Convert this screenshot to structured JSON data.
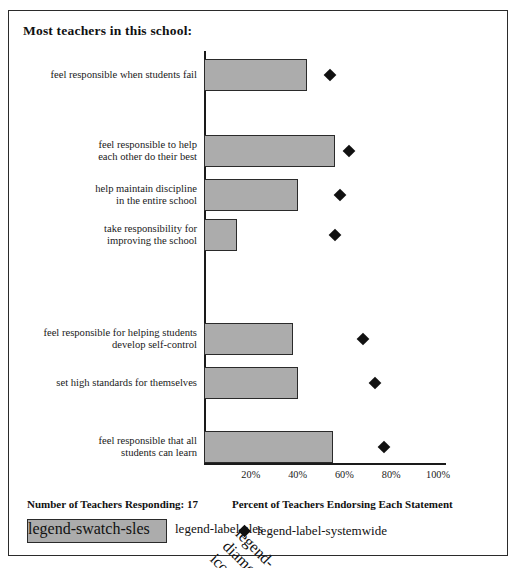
{
  "title": "Most teachers in this school:",
  "legend": {
    "responding_label": "Number of Teachers Responding: 17",
    "axis_caption": "Percent of Teachers Endorsing Each Statement",
    "bar_series_label": "SLES",
    "point_series_label": "Systemwide Average"
  },
  "colors": {
    "bar_fill": "#acacac",
    "bar_border": "#2a2a2a",
    "marker": "#111111",
    "axis": "#1a1a1a",
    "frame": "#2b2b2b"
  },
  "ticks": [
    "20%",
    "40%",
    "60%",
    "80%",
    "100%"
  ],
  "chart_data": {
    "type": "bar",
    "orientation": "horizontal",
    "title": "Most teachers in this school:",
    "xlabel": "Percent of Teachers Endorsing Each Statement",
    "ylabel": "",
    "xlim": [
      0,
      100
    ],
    "xticks": [
      20,
      40,
      60,
      80,
      100
    ],
    "xtick_labels": [
      "20%",
      "40%",
      "60%",
      "80%",
      "100%"
    ],
    "grid": false,
    "legend_position": "bottom",
    "categories": [
      "feel responsible when students fail",
      "feel responsible to help each other do their best",
      "help maintain discipline in the entire school",
      "take responsibility for improving the school",
      "feel responsible for helping students develop self-control",
      "set high standards for themselves",
      "feel responsible that all students can learn"
    ],
    "series": [
      {
        "name": "SLES",
        "type": "bar",
        "values": [
          44,
          56,
          40,
          14,
          38,
          40,
          55
        ]
      },
      {
        "name": "Systemwide Average",
        "type": "scatter",
        "marker": "diamond",
        "values": [
          54,
          62,
          58,
          56,
          68,
          73,
          77
        ]
      }
    ],
    "n_responding": 17
  },
  "rows": [
    {
      "label_line1": "feel responsible when students fail",
      "label_line2": "",
      "top": 48,
      "label_top": 58
    },
    {
      "label_line1": "feel responsible to help",
      "label_line2": "each other do their best",
      "top": 124,
      "label_top": 128
    },
    {
      "label_line1": "help maintain discipline",
      "label_line2": "in the entire school",
      "top": 168,
      "label_top": 172
    },
    {
      "label_line1": "take responsibility for",
      "label_line2": "improving the school",
      "top": 208,
      "label_top": 212
    },
    {
      "label_line1": "feel responsible for helping students",
      "label_line2": "develop self-control",
      "top": 312,
      "label_top": 316
    },
    {
      "label_line1": "set high standards for themselves",
      "label_line2": "",
      "top": 356,
      "label_top": 366
    },
    {
      "label_line1": "feel responsible that all",
      "label_line2": "students can learn",
      "top": 420,
      "label_top": 424
    }
  ]
}
